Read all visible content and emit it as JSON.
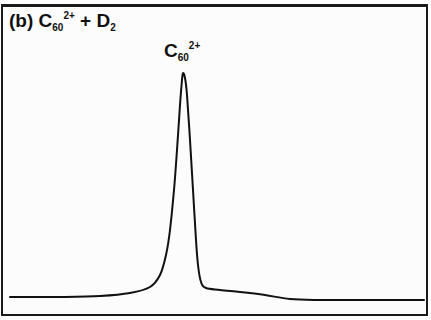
{
  "chart_data": {
    "type": "line",
    "title_parts": {
      "panel": "(b)",
      "species": "C",
      "subscript": "60",
      "superscript": "2+",
      "plus": "+",
      "reactant": "D",
      "reactant_subscript": "2"
    },
    "annotations": [
      {
        "text": "C60 2+",
        "base": "C",
        "subscript": "60",
        "superscript": "2+",
        "x_px": 183,
        "y_px": 73
      }
    ],
    "xlabel": "",
    "ylabel": "",
    "grid": false,
    "legend": null,
    "axes_ticks": "none shown",
    "series": [
      {
        "name": "C60 2+ signal",
        "color": "#111111",
        "points_px": [
          [
            10,
            297
          ],
          [
            60,
            297
          ],
          [
            100,
            296
          ],
          [
            130,
            293
          ],
          [
            150,
            287
          ],
          [
            160,
            275
          ],
          [
            166,
            255
          ],
          [
            170,
            230
          ],
          [
            174,
            190
          ],
          [
            177,
            150
          ],
          [
            180,
            105
          ],
          [
            182,
            80
          ],
          [
            183,
            73
          ],
          [
            185,
            78
          ],
          [
            187,
            95
          ],
          [
            190,
            140
          ],
          [
            193,
            190
          ],
          [
            196,
            240
          ],
          [
            198,
            265
          ],
          [
            201,
            282
          ],
          [
            206,
            288
          ],
          [
            220,
            290
          ],
          [
            240,
            292
          ],
          [
            265,
            295
          ],
          [
            290,
            299
          ],
          [
            320,
            300
          ],
          [
            360,
            300
          ],
          [
            400,
            300
          ],
          [
            424,
            300
          ]
        ]
      }
    ]
  }
}
